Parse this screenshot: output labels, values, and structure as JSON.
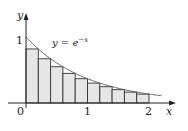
{
  "diagram": {
    "function_label": "y = e",
    "function_exponent": "−x",
    "axis_x_label": "x",
    "axis_y_label": "y",
    "ticks_x": [
      "0",
      "1",
      "2"
    ],
    "tick_y": "1",
    "colors": {
      "fill": "#e6e6e6",
      "stroke": "#333333",
      "curve": "#555555"
    }
  },
  "chart_data": {
    "type": "area",
    "xlabel": "x",
    "ylabel": "y",
    "xlim": [
      0,
      2.2
    ],
    "ylim": [
      0,
      1.1
    ],
    "n_rectangles": 10,
    "rect_x_left": [
      0,
      0.2,
      0.4,
      0.6,
      0.8,
      1.0,
      1.2,
      1.4,
      1.6,
      1.8
    ],
    "rect_heights": [
      0.819,
      0.67,
      0.549,
      0.449,
      0.368,
      0.301,
      0.247,
      0.202,
      0.165,
      0.135
    ]
  }
}
